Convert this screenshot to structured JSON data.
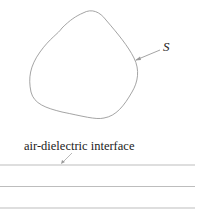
{
  "diagram": {
    "surface_label": "S",
    "interface_label": "air-dielectric interface",
    "stroke_color": "#9a9a9a",
    "text_color": "#222222",
    "layer_lines_count": 3
  }
}
